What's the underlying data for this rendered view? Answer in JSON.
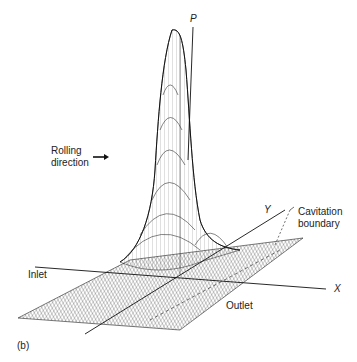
{
  "figure": {
    "panel_label": "(b)",
    "type": "3D mesh surface plot of pressure distribution",
    "axes": {
      "vertical": "P",
      "y": "Y",
      "x": "X"
    },
    "labels": {
      "rolling_line1": "Rolling",
      "rolling_line2": "direction",
      "inlet": "Inlet",
      "outlet": "Outlet",
      "cavitation_line1": "Cavitation",
      "cavitation_line2": "boundary"
    },
    "icons": {
      "rolling_arrow": "arrow-right-icon"
    },
    "colors": {
      "ink": "#1a1a1a",
      "background": "#ffffff"
    }
  }
}
